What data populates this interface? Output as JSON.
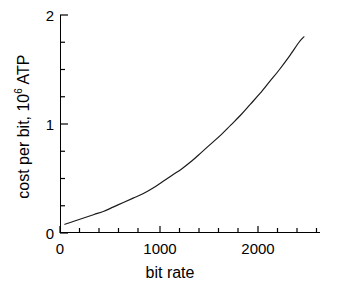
{
  "chart_data": {
    "type": "line",
    "title": "",
    "xlabel": "bit rate",
    "ylabel_prefix": "cost per bit, 10",
    "ylabel_exponent": "6",
    "ylabel_suffix": " ATP",
    "ylabel_full": "cost per bit, 10^6 ATP",
    "xlim": [
      0,
      2665
    ],
    "ylim": [
      0,
      2
    ],
    "xticks": [
      0,
      1000,
      2000
    ],
    "xtick_labels": [
      "0",
      "1000",
      "2000"
    ],
    "yticks": [
      0,
      1,
      2
    ],
    "ytick_labels": [
      "0",
      "1",
      "2"
    ],
    "x_minor_step": 200,
    "y_minor_step": 0.25,
    "grid": false,
    "legend": null,
    "series": [
      {
        "name": "cost per bit",
        "color": "#1a1a1a",
        "line_width": 1.2,
        "x": [
          50,
          150,
          250,
          350,
          450,
          550,
          650,
          750,
          850,
          950,
          1050,
          1150,
          1250,
          1350,
          1450,
          1550,
          1650,
          1750,
          1850,
          1950,
          2050,
          2150,
          2250,
          2350,
          2450,
          2500
        ],
        "y": [
          0.08,
          0.11,
          0.14,
          0.17,
          0.2,
          0.24,
          0.28,
          0.32,
          0.36,
          0.41,
          0.47,
          0.53,
          0.59,
          0.66,
          0.74,
          0.82,
          0.9,
          0.99,
          1.08,
          1.18,
          1.28,
          1.39,
          1.5,
          1.62,
          1.75,
          1.8
        ]
      }
    ]
  },
  "axes": {
    "x_title": "bit rate",
    "y_title_prefix": "cost per bit, 10",
    "y_title_exponent": "6",
    "y_title_suffix": " ATP",
    "x_tick_0": "0",
    "x_tick_1": "1000",
    "x_tick_2": "2000",
    "y_tick_0": "0",
    "y_tick_1": "1",
    "y_tick_2": "2"
  }
}
